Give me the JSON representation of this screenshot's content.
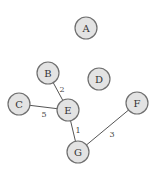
{
  "graph": {
    "nodes": [
      {
        "id": "A",
        "label": "A",
        "x": 86,
        "y": 28
      },
      {
        "id": "B",
        "label": "B",
        "x": 48,
        "y": 73
      },
      {
        "id": "D",
        "label": "D",
        "x": 99,
        "y": 79
      },
      {
        "id": "C",
        "label": "C",
        "x": 19,
        "y": 104
      },
      {
        "id": "E",
        "label": "E",
        "x": 68,
        "y": 110
      },
      {
        "id": "F",
        "label": "F",
        "x": 137,
        "y": 103
      },
      {
        "id": "G",
        "label": "G",
        "x": 78,
        "y": 152
      }
    ],
    "edges": [
      {
        "from": "B",
        "to": "E",
        "weight": "2",
        "label_x": 62,
        "label_y": 89
      },
      {
        "from": "C",
        "to": "E",
        "weight": "5",
        "label_x": 44,
        "label_y": 114
      },
      {
        "from": "E",
        "to": "G",
        "weight": "1",
        "label_x": 78,
        "label_y": 130
      },
      {
        "from": "G",
        "to": "F",
        "weight": "3",
        "label_x": 112,
        "label_y": 134
      }
    ],
    "node_radius": 11,
    "colors": {
      "node_fill": "#e3e3e3",
      "node_stroke": "#6f6f6f",
      "edge": "#555555",
      "text": "#333333"
    }
  }
}
